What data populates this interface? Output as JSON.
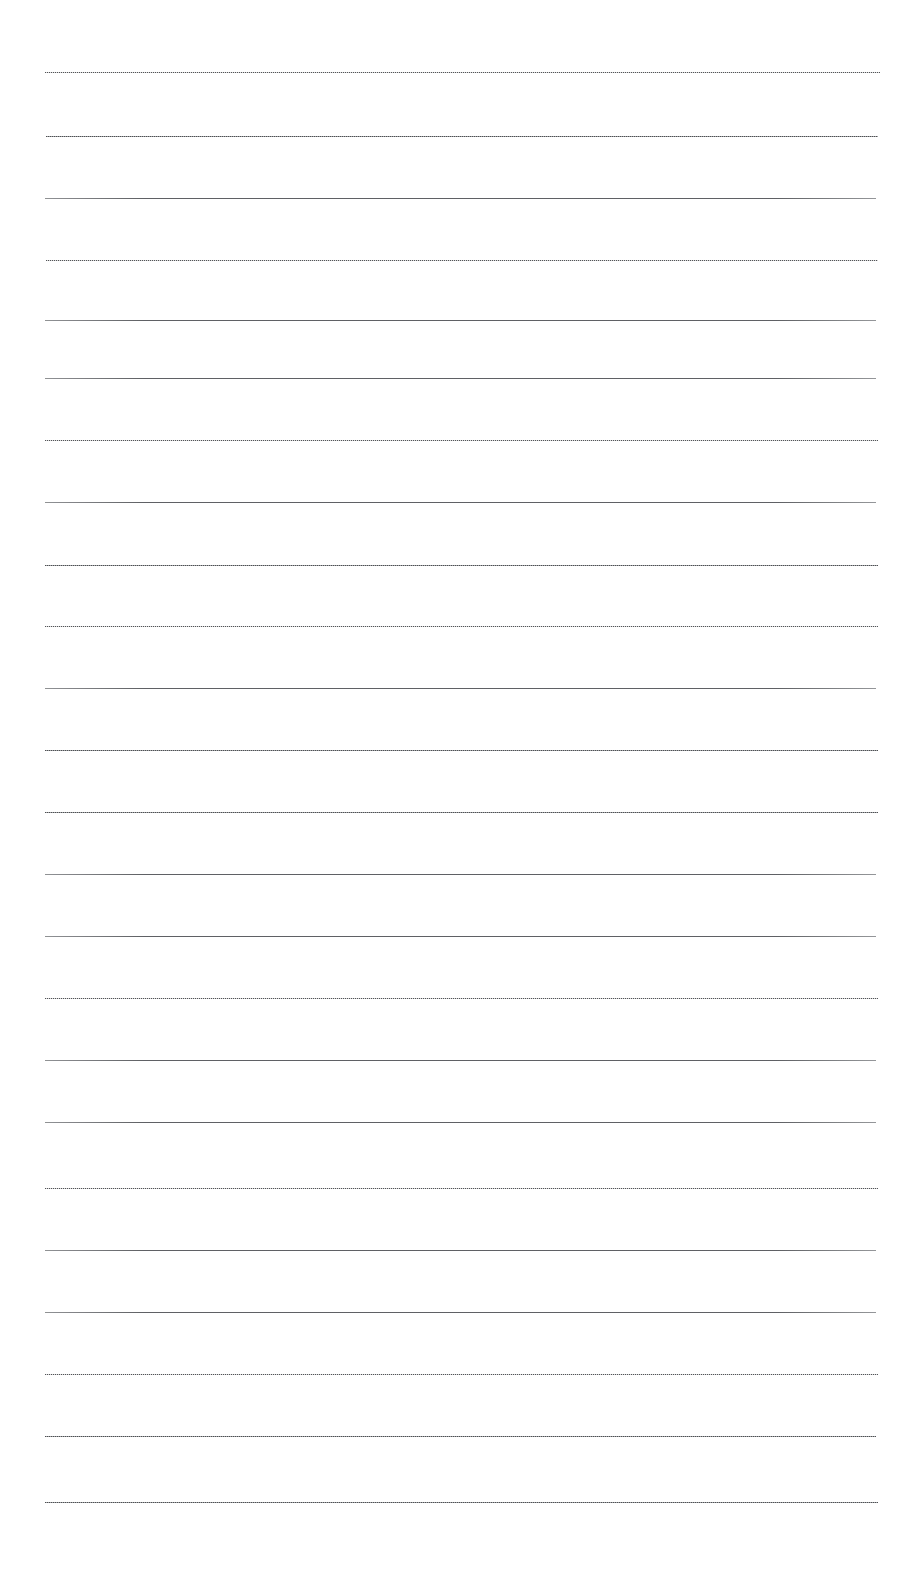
{
  "document": {
    "kind": "blank-ruled-page",
    "description": "Scanned blank lined writing paper",
    "page_width": 920,
    "page_height": 1579,
    "background_color": "#ffffff",
    "rule_color": "#8d8f92",
    "has_text": false,
    "text_content": "",
    "margins": {
      "left": 45,
      "right": 878,
      "top": 72,
      "bottom": 1502
    },
    "rules": {
      "count": 24,
      "first_y": 72,
      "spacing": 62.2,
      "left_x": 45,
      "right_x": 878,
      "thickness": 1,
      "lines": [
        {
          "y": 72,
          "x1": 45,
          "x2": 880,
          "style": "stipple"
        },
        {
          "y": 136,
          "x1": 46,
          "x2": 878,
          "style": "dotted"
        },
        {
          "y": 198,
          "x1": 45,
          "x2": 876,
          "style": "solid"
        },
        {
          "y": 260,
          "x1": 46,
          "x2": 878,
          "style": "stipple"
        },
        {
          "y": 320,
          "x1": 45,
          "x2": 876,
          "style": "solid"
        },
        {
          "y": 378,
          "x1": 45,
          "x2": 876,
          "style": "solid"
        },
        {
          "y": 440,
          "x1": 45,
          "x2": 878,
          "style": "stipple"
        },
        {
          "y": 502,
          "x1": 45,
          "x2": 876,
          "style": "solid"
        },
        {
          "y": 565,
          "x1": 45,
          "x2": 878,
          "style": "dotted"
        },
        {
          "y": 626,
          "x1": 45,
          "x2": 878,
          "style": "stipple"
        },
        {
          "y": 688,
          "x1": 45,
          "x2": 876,
          "style": "solid"
        },
        {
          "y": 750,
          "x1": 45,
          "x2": 878,
          "style": "dotted"
        },
        {
          "y": 812,
          "x1": 45,
          "x2": 878,
          "style": "dotted"
        },
        {
          "y": 874,
          "x1": 45,
          "x2": 876,
          "style": "solid"
        },
        {
          "y": 936,
          "x1": 45,
          "x2": 876,
          "style": "solid"
        },
        {
          "y": 998,
          "x1": 45,
          "x2": 878,
          "style": "stipple"
        },
        {
          "y": 1060,
          "x1": 45,
          "x2": 876,
          "style": "solid"
        },
        {
          "y": 1122,
          "x1": 45,
          "x2": 876,
          "style": "solid"
        },
        {
          "y": 1188,
          "x1": 45,
          "x2": 878,
          "style": "stipple"
        },
        {
          "y": 1250,
          "x1": 45,
          "x2": 876,
          "style": "solid"
        },
        {
          "y": 1312,
          "x1": 45,
          "x2": 876,
          "style": "solid"
        },
        {
          "y": 1374,
          "x1": 45,
          "x2": 878,
          "style": "stipple"
        },
        {
          "y": 1436,
          "x1": 45,
          "x2": 876,
          "style": "dotted"
        },
        {
          "y": 1502,
          "x1": 45,
          "x2": 878,
          "style": "dotted"
        }
      ]
    }
  }
}
